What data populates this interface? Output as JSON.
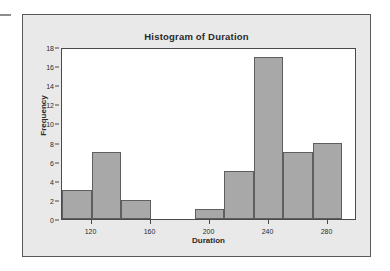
{
  "panel": {
    "background_color": "#e9e9e9",
    "border_color": "#5a5a5a"
  },
  "chart_data": {
    "type": "bar",
    "title": "Histogram of Duration",
    "xlabel": "Duration",
    "ylabel": "Frequency",
    "xlim": [
      100,
      300
    ],
    "ylim": [
      0,
      18
    ],
    "grid": false,
    "legend": null,
    "bin_width": 20,
    "bar_color": "#a8a8a8",
    "bar_edge_color": "#5e5e5e",
    "x_ticks": [
      120,
      160,
      200,
      240,
      280
    ],
    "x_tick_labels": [
      "120",
      "160",
      "200",
      "240",
      "280"
    ],
    "y_ticks": [
      0,
      2,
      4,
      6,
      8,
      10,
      12,
      14,
      16,
      18
    ],
    "y_tick_labels": [
      "0",
      "2",
      "4",
      "6",
      "8",
      "10",
      "12",
      "14",
      "16",
      "18"
    ],
    "bins": [
      {
        "start": 100,
        "end": 120,
        "value": 3
      },
      {
        "start": 120,
        "end": 140,
        "value": 7
      },
      {
        "start": 140,
        "end": 160,
        "value": 2
      },
      {
        "start": 160,
        "end": 180,
        "value": 0
      },
      {
        "start": 180,
        "end": 190,
        "value": 0
      },
      {
        "start": 190,
        "end": 210,
        "value": 1
      },
      {
        "start": 210,
        "end": 230,
        "value": 5
      },
      {
        "start": 230,
        "end": 250,
        "value": 17
      },
      {
        "start": 250,
        "end": 270,
        "value": 7
      },
      {
        "start": 270,
        "end": 290,
        "value": 8
      }
    ],
    "categories": [
      "100-120",
      "120-140",
      "140-160",
      "190-210",
      "210-230",
      "230-250",
      "250-270",
      "270-290"
    ],
    "values": [
      3,
      7,
      2,
      1,
      5,
      17,
      7,
      8
    ]
  }
}
